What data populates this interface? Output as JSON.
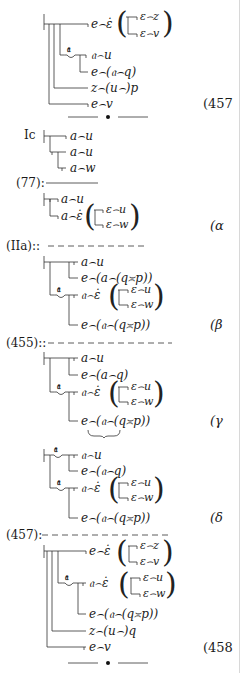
{
  "block_457_premise": {
    "lines": {
      "top": "e⌢ε̇",
      "paren_top": "ε⌢z",
      "paren_bottom": "ε⌢v",
      "gothic_u": "𝔞⌢u",
      "e_gothic_q": "e⌢(𝔞⌢q)",
      "z_u_p": "z⌢(u⌢)p",
      "e_v": "e⌢v"
    },
    "concavity_letter": "𝔞",
    "tag": "(457"
  },
  "separator_top": "•",
  "ic_block": {
    "label": "Ic",
    "lines": [
      "a⌢u",
      "a⌢u",
      "a⌢w"
    ]
  },
  "inference_77": {
    "label": "(77):",
    "line_style": "solid"
  },
  "alpha": {
    "lines": {
      "a_u": "a⌢u",
      "a_eps": "a⌢ε̇",
      "paren_top": "ε⌢u",
      "paren_bottom": "ε⌢w"
    },
    "tag": "(α"
  },
  "inference_IIa": {
    "label": "(IIa)::",
    "line_style": "dashed"
  },
  "beta": {
    "lines": {
      "a_u": "a⌢u",
      "e_a_qp": "e⌢(a⌢(q≍p))",
      "gothic_eps": "𝔞⌢ε̇",
      "paren_top": "ε⌢u",
      "paren_bottom": "ε⌢w",
      "e_gothic_qp": "e⌢(𝔞⌢(q≍p))"
    },
    "concavity_letter": "𝔞",
    "tag": "(β"
  },
  "inference_455": {
    "label": "(455)::",
    "line_style": "dashed"
  },
  "gamma": {
    "lines": {
      "a_u": "a⌢u",
      "e_a_q": "e⌢(a⌢q)",
      "gothic_eps": "𝔞⌢ε̇",
      "paren_top": "ε⌢u",
      "paren_bottom": "ε⌢w",
      "e_gothic_qp": "e⌢(𝔞⌢(q≍p))"
    },
    "concavity_letter": "𝔞",
    "underbrace": "⏟",
    "tag": "(γ"
  },
  "delta": {
    "lines": {
      "gothic_u": "𝔞⌢u",
      "e_gothic_q": "e⌢(𝔞⌢q)",
      "gothic_eps": "𝔞⌢ε̇",
      "paren_top": "ε⌢u",
      "paren_bottom": "ε⌢w",
      "e_gothic_qp": "e⌢(𝔞⌢(q≍p))"
    },
    "concavity_letters": [
      "𝔞",
      "𝔞"
    ],
    "tag": "(δ"
  },
  "inference_457": {
    "label": "(457):",
    "line_style": "dashed"
  },
  "block_458": {
    "lines": {
      "top": "e⌢ε̇",
      "paren_top": "ε⌢z",
      "paren_bottom": "ε⌢v",
      "gothic_eps": "𝔞⌢ε̇",
      "paren2_top": "ε⌢u",
      "paren2_bottom": "ε⌢w",
      "e_gothic_qp": "e⌢(𝔞⌢(q≍p))",
      "z_u_q": "z⌢(u⌢)q",
      "e_v": "e⌢v"
    },
    "concavity_letter": "𝔞",
    "tag": "(458"
  },
  "separator_bottom": "•"
}
